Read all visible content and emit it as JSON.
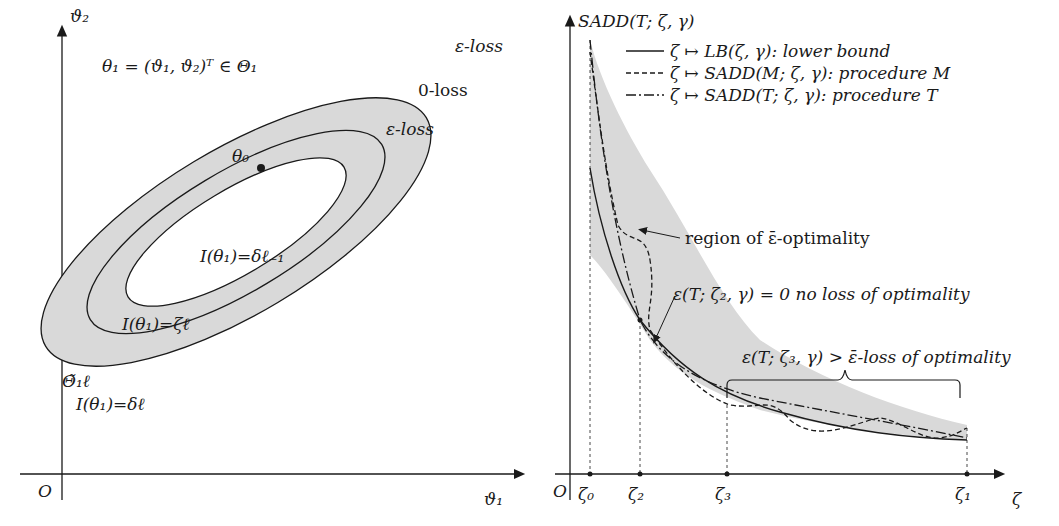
{
  "left_panel": {
    "y_axis_label": "ϑ₂",
    "x_axis_label": "ϑ₁",
    "origin_label": "O",
    "theta_def": "θ₁ = (ϑ₁, ϑ₂)ᵀ ∈ Θ₁",
    "center_label": "θ₀",
    "outer_loss_label": "ε-loss",
    "zero_loss_label": "0-loss",
    "inner_loss_label": "ε-loss",
    "inner_contour_label": "I(θ₁)=δℓ₋₁",
    "zeta_contour_label": "I(θ₁)=ζℓ",
    "region_label": "Θ̃₁ℓ",
    "outer_contour_label": "I(θ₁)=δℓ",
    "fill_color": "#d9d9d9"
  },
  "right_panel": {
    "y_axis_label": "SADD(T; ζ, γ)",
    "x_axis_label": "ζ",
    "origin_label": "O",
    "x_ticks": [
      "ζ₀",
      "ζ₂",
      "ζ₃",
      "ζ₁"
    ],
    "legend": [
      {
        "style": "solid",
        "label": "ζ ↦ LB(ζ, γ): lower bound"
      },
      {
        "style": "dashed",
        "label": "ζ ↦ SADD(M; ζ, γ): procedure M"
      },
      {
        "style": "dashdot",
        "label": "ζ ↦ SADD(T; ζ, γ): procedure T"
      }
    ],
    "annotation_region": "region of ε̄-optimality",
    "annotation_zero_loss": "ε(T; ζ₂, γ) = 0 no loss of optimality",
    "annotation_loss": "ε(T; ζ₃, γ) > ε̄-loss of optimality",
    "fill_color": "#d9d9d9"
  }
}
